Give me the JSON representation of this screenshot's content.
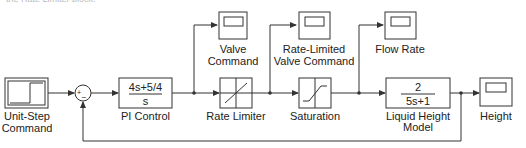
{
  "caption": "the Rate Limiter block.",
  "blocks": {
    "step": {
      "label1": "Unit-Step",
      "label2": "Command"
    },
    "sum": {
      "plus": "+",
      "minus": "−"
    },
    "pi": {
      "num": "4s+5/4",
      "den": "s",
      "label": "PI Control"
    },
    "valve_scope": {
      "label1": "Valve",
      "label2": "Command"
    },
    "rate_limiter": {
      "label": "Rate Limiter"
    },
    "rl_scope": {
      "label1": "Rate-Limited",
      "label2": "Valve Command"
    },
    "saturation": {
      "label": "Saturation"
    },
    "flow_scope": {
      "label": "Flow Rate"
    },
    "plant": {
      "num": "2",
      "den": "5s+1",
      "label1": "Liquid Height",
      "label2": "Model"
    },
    "height_scope": {
      "label": "Height"
    }
  },
  "colors": {
    "line": "#333333",
    "text": "#222222",
    "background": "#ffffff"
  }
}
